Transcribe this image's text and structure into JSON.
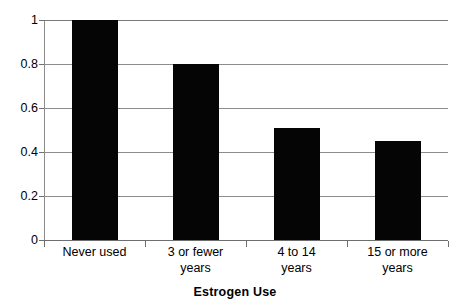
{
  "chart_data": {
    "type": "bar",
    "title": "",
    "xlabel": "Estrogen Use",
    "ylabel": "",
    "categories": [
      "Never used",
      "3 or fewer years",
      "4 to 14 years",
      "15 or more years"
    ],
    "category_lines": [
      [
        "Never used"
      ],
      [
        "3 or fewer",
        "years"
      ],
      [
        "4 to 14",
        "years"
      ],
      [
        "15 or more",
        "years"
      ]
    ],
    "values": [
      1.0,
      0.8,
      0.51,
      0.45
    ],
    "ylim": [
      0,
      1
    ],
    "yticks": [
      0,
      0.2,
      0.4,
      0.6,
      0.8,
      1
    ],
    "ytick_labels": [
      "0",
      "0.2",
      "0.4",
      "0.6",
      "0.8",
      "1"
    ],
    "grid": true,
    "grid_axis": "y",
    "legend": false,
    "bar_color": "#050505",
    "grid_color": "#8c8c8c",
    "axis_color": "#6e6e6e",
    "background": "#ffffff"
  }
}
